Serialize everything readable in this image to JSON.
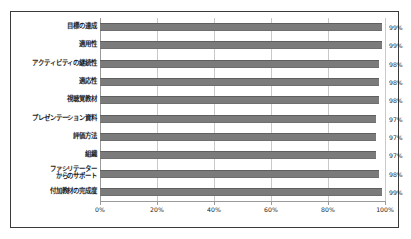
{
  "chart_data": {
    "type": "bar",
    "orientation": "horizontal",
    "title": "",
    "subtitle": "",
    "xlabel": "",
    "ylabel": "",
    "xlim": [
      0,
      100
    ],
    "grid": true,
    "legend": "none",
    "xticks": [
      "0%",
      "20%",
      "40%",
      "60%",
      "80%",
      "100%"
    ],
    "xtick_values": [
      0,
      20,
      40,
      60,
      80,
      100
    ],
    "categories": [
      "目標の達成",
      "適用性",
      "アクティビティの継続性",
      "適応性",
      "視聴覚教材",
      "プレゼンテーション資料",
      "評価方法",
      "組織",
      "ファシリテーター\nからのサポート",
      "付加教材の完成度"
    ],
    "values": [
      99,
      99,
      98,
      98,
      98,
      97,
      97,
      97,
      98,
      99
    ],
    "value_labels": [
      "99%",
      "99%",
      "98%",
      "98%",
      "98%",
      "97%",
      "97%",
      "97%",
      "98%",
      "99%"
    ],
    "series": [
      {
        "name": "",
        "values": [
          99,
          99,
          98,
          98,
          98,
          97,
          97,
          97,
          98,
          99
        ]
      }
    ],
    "colors": {
      "bar": "#7b7b7b",
      "bar_edge": "#5f5f5f",
      "gridline": "#c9c9c9",
      "axis": "#9a9a9a",
      "frame": "#3a3a3a",
      "text": "#1d1d1d",
      "background": "#ffffff"
    }
  }
}
